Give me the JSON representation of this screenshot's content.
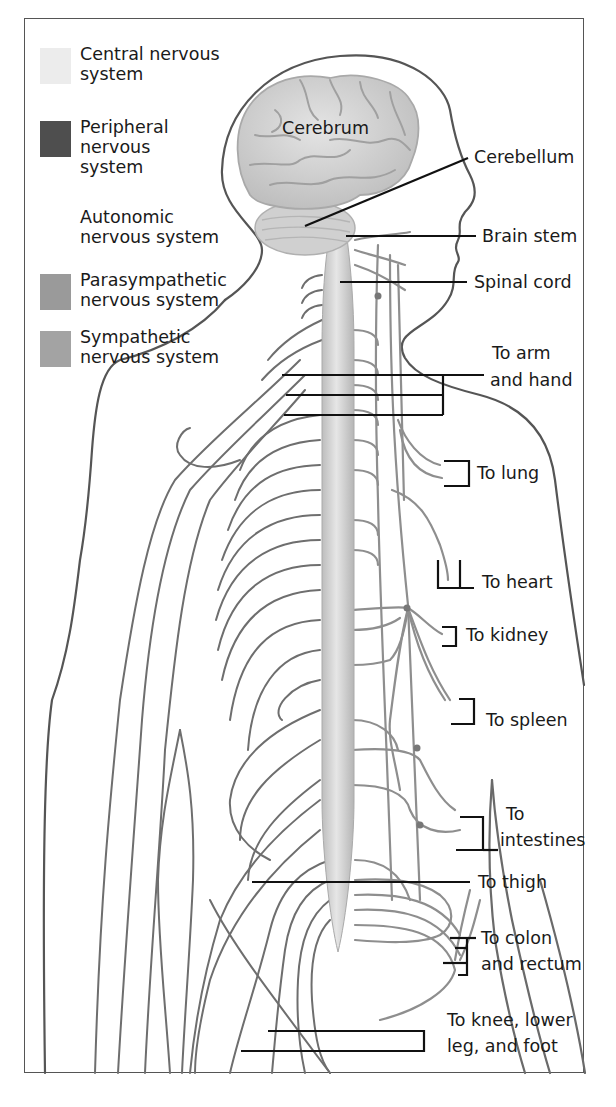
{
  "legend": {
    "central": {
      "label": "Central nervous system",
      "color": "#ececec"
    },
    "peripheral": {
      "label": "Peripheral nervous system",
      "color": "#4e4e4e"
    },
    "autonomic_heading": "Autonomic nervous system",
    "parasympathetic": {
      "label": "Parasympathetic nervous system",
      "color": "#9a9a9a"
    },
    "sympathetic": {
      "label": "Sympathetic nervous system",
      "color": "#a3a3a3"
    }
  },
  "labels": {
    "cerebrum": "Cerebrum",
    "cerebellum": "Cerebellum",
    "brain_stem": "Brain stem",
    "spinal_cord": "Spinal cord",
    "arm_hand_1": "To arm",
    "arm_hand_2": "and hand",
    "lung": "To lung",
    "heart": "To heart",
    "kidney": "To kidney",
    "spleen": "To spleen",
    "intestines_1": "To",
    "intestines_2": "intestines",
    "thigh": "To thigh",
    "colon_1": "To colon",
    "colon_2": "and rectum",
    "knee_1": "To knee, lower",
    "knee_2": "leg, and foot"
  },
  "colors": {
    "outline": "#555555",
    "nerve": "#707070",
    "autonomic_nerve": "#909090",
    "leader": "#111111",
    "brain": "#d6d6d6",
    "cord": "#cfcfcf"
  }
}
